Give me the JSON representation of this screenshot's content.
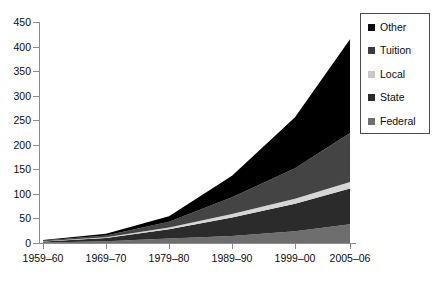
{
  "chart_data": {
    "type": "area",
    "stacked": true,
    "title": "",
    "subtitle": "",
    "xlabel": "",
    "ylabel": "",
    "categories": [
      "1959-60",
      "1969-70",
      "1979-80",
      "1989-90",
      "1999-00",
      "2005-06"
    ],
    "x_tick_labels": [
      "1959–60",
      "1969–70",
      "1979–80",
      "1989–90",
      "1999–00",
      "2005–06"
    ],
    "y_tick_labels": [
      "0",
      "50",
      "100",
      "150",
      "200",
      "250",
      "300",
      "350",
      "400",
      "450"
    ],
    "y_tick_values": [
      0,
      50,
      100,
      150,
      200,
      250,
      300,
      350,
      400,
      450
    ],
    "ylim": [
      0,
      450
    ],
    "grid": false,
    "legend_position": "top-right",
    "stack_order_bottom_to_top": [
      "Federal",
      "State",
      "Local",
      "Tuition",
      "Other"
    ],
    "series": [
      {
        "name": "Federal",
        "color": "#6e6e6e",
        "values": [
          1.0,
          3.5,
          9.0,
          14.0,
          24.0,
          38.0
        ]
      },
      {
        "name": "State",
        "color": "#2b2b2b",
        "values": [
          2.0,
          6.5,
          19.0,
          38.0,
          56.0,
          73.0
        ]
      },
      {
        "name": "Local",
        "color": "#d6d6d6",
        "values": [
          0.5,
          1.5,
          3.5,
          7.0,
          10.0,
          13.0
        ]
      },
      {
        "name": "Tuition",
        "color": "#444444",
        "values": [
          1.5,
          4.0,
          12.0,
          34.0,
          62.0,
          100.0
        ]
      },
      {
        "name": "Other",
        "color": "#000000",
        "values": [
          1.0,
          3.5,
          11.0,
          44.0,
          104.0,
          191.0
        ]
      }
    ],
    "totals": [
      6.0,
      19.0,
      54.5,
      137.0,
      256.0,
      415.0
    ]
  },
  "legend": {
    "items": [
      {
        "label": "Other",
        "color": "#0a0a0a"
      },
      {
        "label": "Tuition",
        "color": "#3d3d3d"
      },
      {
        "label": "Local",
        "color": "#c9c9c9"
      },
      {
        "label": "State",
        "color": "#2b2b2b"
      },
      {
        "label": "Federal",
        "color": "#707070"
      }
    ]
  },
  "axis": {
    "y_labels": [
      "450",
      "400",
      "350",
      "300",
      "250",
      "200",
      "150",
      "100",
      "50",
      "0"
    ],
    "x_labels": [
      "1959–60",
      "1969–70",
      "1979–80",
      "1989–90",
      "1999–00",
      "2005–06"
    ]
  }
}
